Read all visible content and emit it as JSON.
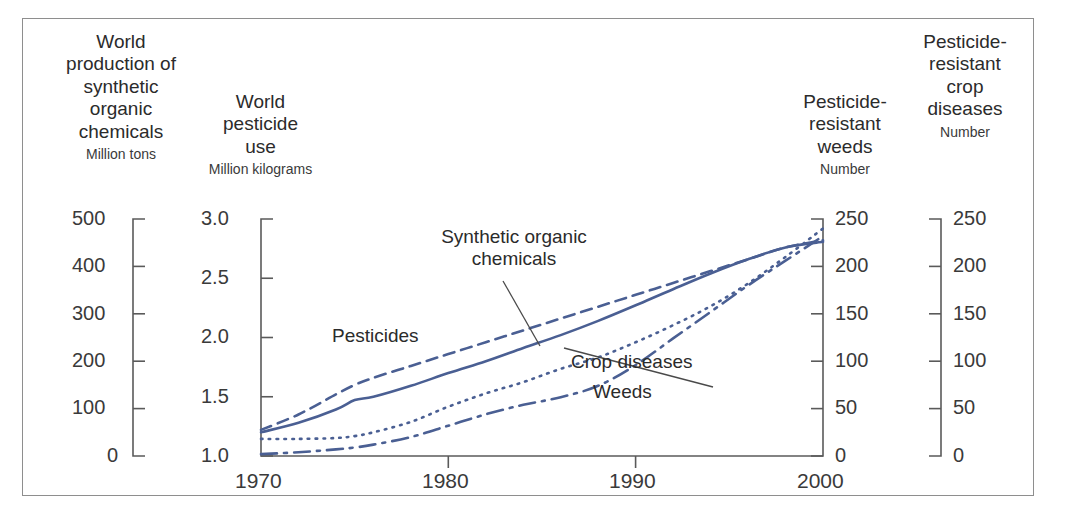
{
  "figure": {
    "border_color": "#8e8e8e",
    "series_color": "#4a5f93"
  },
  "axes": [
    {
      "id": "synthetic-organic-chemicals",
      "title": "World\nproduction of\nsynthetic\norganic\nchemicals",
      "title_lines": [
        "World",
        "production of",
        "synthetic",
        "organic",
        "chemicals"
      ],
      "units": "Million tons",
      "ticks": [
        "500",
        "400",
        "300",
        "200",
        "100",
        "0"
      ],
      "range": [
        0,
        500
      ],
      "side": "left"
    },
    {
      "id": "world-pesticide-use",
      "title_lines": [
        "World",
        "pesticide",
        "use"
      ],
      "units": "Million kilograms",
      "ticks": [
        "3.0",
        "2.5",
        "2.0",
        "1.5",
        "1.0"
      ],
      "range": [
        1.0,
        3.0
      ],
      "side": "left"
    },
    {
      "id": "pesticide-resistant-weeds",
      "title_lines": [
        "Pesticide-",
        "resistant",
        "weeds"
      ],
      "units": "Number",
      "ticks": [
        "250",
        "200",
        "150",
        "100",
        "50",
        "0"
      ],
      "range": [
        0,
        250
      ],
      "side": "right"
    },
    {
      "id": "pesticide-resistant-crop-diseases",
      "title_lines": [
        "Pesticide-",
        "resistant",
        "crop",
        "diseases"
      ],
      "units": "Number",
      "ticks": [
        "250",
        "200",
        "150",
        "100",
        "50",
        "0"
      ],
      "range": [
        0,
        250
      ],
      "side": "right"
    }
  ],
  "xaxis": {
    "ticks": [
      "1970",
      "1980",
      "1990",
      "2000"
    ],
    "range": [
      1970,
      2000
    ]
  },
  "series_labels": [
    {
      "id": "synthetic-organic-chemicals",
      "text": "Synthetic organic\nchemicals",
      "line1": "Synthetic organic",
      "line2": "chemicals"
    },
    {
      "id": "pesticides",
      "text": "Pesticides"
    },
    {
      "id": "crop-diseases",
      "text": "Crop diseases"
    },
    {
      "id": "weeds",
      "text": "Weeds"
    }
  ],
  "chart_data": {
    "type": "line",
    "title": "",
    "xlabel": "",
    "ylabel": "",
    "grid": false,
    "legend": "inline-annotations",
    "x": [
      1970,
      1972,
      1974,
      1975,
      1976,
      1978,
      1980,
      1982,
      1984,
      1986,
      1988,
      1990,
      1992,
      1994,
      1996,
      1998,
      2000
    ],
    "xlim": [
      1970,
      2000
    ],
    "series": [
      {
        "name": "Synthetic organic chemicals",
        "axis": "World production of synthetic organic chemicals (Million tons)",
        "units": "Million tons",
        "style": "solid",
        "ylim": [
          0,
          500
        ],
        "values": [
          50,
          70,
          98,
          118,
          125,
          148,
          175,
          200,
          228,
          255,
          285,
          318,
          352,
          385,
          415,
          440,
          452
        ]
      },
      {
        "name": "Pesticides",
        "axis": "World pesticide use (Million kilograms)",
        "units": "Million kilograms",
        "style": "dashed",
        "ylim": [
          1.0,
          3.0
        ],
        "values": [
          1.22,
          1.35,
          1.52,
          1.6,
          1.66,
          1.76,
          1.86,
          1.96,
          2.06,
          2.16,
          2.26,
          2.36,
          2.46,
          2.56,
          2.66,
          2.76,
          2.82
        ]
      },
      {
        "name": "Crop diseases",
        "axis": "Pesticide-resistant crop diseases (Number)",
        "units": "Number",
        "style": "dotted",
        "ylim": [
          0,
          250
        ],
        "values": [
          18,
          18,
          19,
          21,
          25,
          36,
          52,
          66,
          78,
          92,
          104,
          120,
          138,
          158,
          182,
          210,
          240
        ]
      },
      {
        "name": "Weeds",
        "axis": "Pesticide-resistant weeds (Number)",
        "units": "Number",
        "style": "dash-dot",
        "ylim": [
          0,
          250
        ],
        "values": [
          2,
          4,
          7,
          9,
          12,
          20,
          32,
          44,
          54,
          62,
          74,
          96,
          124,
          152,
          180,
          206,
          232
        ]
      }
    ]
  }
}
